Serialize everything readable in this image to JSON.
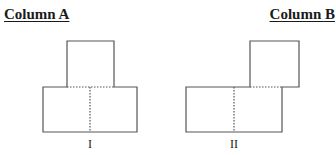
{
  "headings": {
    "column_a": "Column A",
    "column_b": "Column B"
  },
  "figures": [
    {
      "label": "I",
      "description": "Square centered on top of a rectangle made of two squares; dotted lines mark internal edges",
      "top_square": {
        "x": 67,
        "y": 41,
        "w": 47,
        "h": 46
      },
      "bottom_rect": {
        "x": 43,
        "y": 87,
        "w": 94,
        "h": 45
      },
      "divider_x": 90,
      "label_x": 90
    },
    {
      "label": "II",
      "description": "Square offset to the upper right, overlapping the right half of a rectangle made of two squares; dotted lines mark internal edges",
      "top_square": {
        "x": 250,
        "y": 41,
        "w": 49,
        "h": 46
      },
      "bottom_rect": {
        "x": 186,
        "y": 87,
        "w": 96,
        "h": 45
      },
      "divider_x": 234,
      "label_x": 234
    }
  ],
  "colors": {
    "stroke": "#555555",
    "text": "#1a1a1a",
    "background": "#ffffff"
  }
}
